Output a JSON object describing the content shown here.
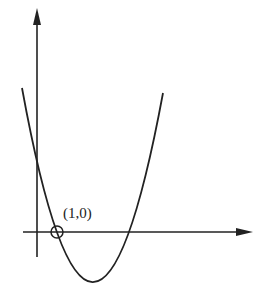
{
  "diagram": {
    "type": "parabola-graph",
    "point_label": "(1,0)",
    "colors": {
      "stroke": "#222222",
      "background": "#ffffff"
    },
    "axes": {
      "x_axis": {
        "arrow": "right"
      },
      "y_axis": {
        "arrow": "up"
      }
    },
    "marked_point": {
      "label": "(1,0)",
      "marker": "open-circle-with-crosshair"
    }
  }
}
